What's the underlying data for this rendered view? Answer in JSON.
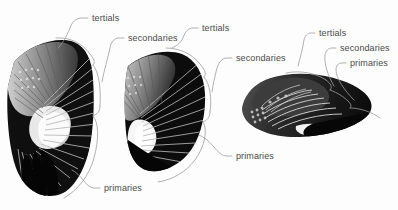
{
  "figure": {
    "background_color": "#fdfdfd",
    "label_color": "#4a4a4a",
    "leader_line_color": "#9a9a9a",
    "feather_dark_color": "#0a0a0a",
    "feather_mid_color": "#6e6e6e",
    "feather_light_color": "#f2f2f2"
  },
  "panels": [
    {
      "id": "wing-spread",
      "name": "fully-spread-wing",
      "posture": "fully spread",
      "labels": [
        {
          "id": "tertials",
          "text": "tertials"
        },
        {
          "id": "secondaries",
          "text": "secondaries"
        },
        {
          "id": "primaries",
          "text": "primaries"
        }
      ]
    },
    {
      "id": "wing-partial",
      "name": "partially-folded-wing",
      "posture": "partially folded",
      "labels": [
        {
          "id": "tertials",
          "text": "tertials"
        },
        {
          "id": "secondaries",
          "text": "secondaries"
        },
        {
          "id": "primaries",
          "text": "primaries"
        }
      ]
    },
    {
      "id": "wing-folded",
      "name": "folded-wing",
      "posture": "folded",
      "labels": [
        {
          "id": "tertials",
          "text": "tertials"
        },
        {
          "id": "secondaries",
          "text": "secondaries"
        },
        {
          "id": "primaries",
          "text": "primaries"
        }
      ]
    }
  ]
}
